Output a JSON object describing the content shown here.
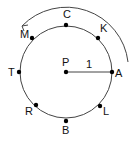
{
  "diagram": {
    "center": {
      "label": "P",
      "x": 66,
      "y": 72
    },
    "radius": 46,
    "radius_label": "1",
    "points": [
      {
        "label": "C",
        "x": 66,
        "y": 25,
        "lx": 63,
        "ly": 18
      },
      {
        "label": "K",
        "x": 98,
        "y": 38,
        "lx": 100,
        "ly": 32
      },
      {
        "label": "A",
        "x": 112,
        "y": 72,
        "lx": 115,
        "ly": 77
      },
      {
        "label": "L",
        "x": 100,
        "y": 106,
        "lx": 103,
        "ly": 115
      },
      {
        "label": "B",
        "x": 66,
        "y": 121,
        "lx": 62,
        "ly": 134
      },
      {
        "label": "R",
        "x": 36,
        "y": 105,
        "lx": 25,
        "ly": 115
      },
      {
        "label": "T",
        "x": 19,
        "y": 72,
        "lx": 8,
        "ly": 76
      },
      {
        "label": "M",
        "x": 32,
        "y": 38,
        "lx": 20,
        "ly": 38
      }
    ],
    "arrow": {
      "direction": "counterclockwise"
    },
    "colors": {
      "line": "#444444",
      "point": "#000000",
      "text": "#111111"
    }
  }
}
